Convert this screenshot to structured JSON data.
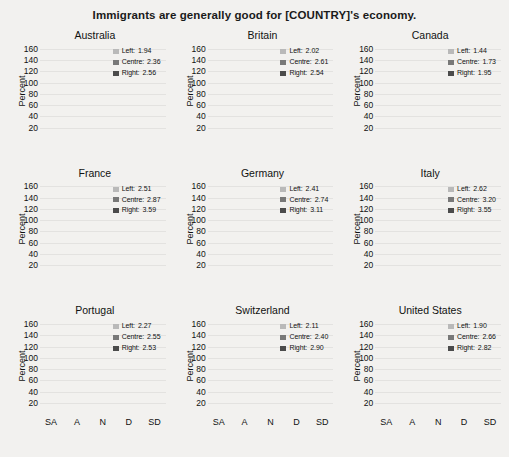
{
  "title": "Immigrants are generally good for [COUNTRY]'s economy.",
  "axis": {
    "ylabel": "Percent",
    "yticks": [
      20,
      40,
      60,
      80,
      100,
      120,
      140,
      160
    ],
    "ylim": [
      0,
      170
    ],
    "xticks": [
      "SA",
      "A",
      "N",
      "D",
      "SD"
    ]
  },
  "series_names": [
    "Left",
    "Centre",
    "Right"
  ],
  "colors": {
    "left": "#b9b9b9",
    "centre": "#787878",
    "right": "#4b4b4b",
    "background": "#f2f1ef",
    "gridline": "#e3e2e0"
  },
  "chart_data": {
    "type": "bar",
    "title": "Immigrants are generally good for [COUNTRY]'s economy.",
    "xlabel": "",
    "ylabel": "Percent",
    "ylim": [
      0,
      170
    ],
    "categories": [
      "SA",
      "A",
      "N",
      "D",
      "SD"
    ],
    "stacked": true,
    "grid": true,
    "legend_position": "top-right",
    "panels": [
      {
        "name": "Australia",
        "legend": [
          {
            "label": "Left:",
            "value": "1.94"
          },
          {
            "label": "Centre:",
            "value": "2.36"
          },
          {
            "label": "Right:",
            "value": "2.56"
          }
        ],
        "series": [
          {
            "name": "Right",
            "values": [
              17,
              46,
              17,
              11,
              9
            ]
          },
          {
            "name": "Centre",
            "values": [
              17,
              44,
              22,
              10,
              5
            ]
          },
          {
            "name": "Left",
            "values": [
              37,
              45,
              12,
              5,
              4
            ]
          }
        ],
        "totals": [
          71,
          135,
          51,
          26,
          18
        ]
      },
      {
        "name": "Britain",
        "legend": [
          {
            "label": "Left:",
            "value": "2.02"
          },
          {
            "label": "Centre:",
            "value": "2.61"
          },
          {
            "label": "Right:",
            "value": "2.54"
          }
        ],
        "series": [
          {
            "name": "Right",
            "values": [
              15,
              37,
              22,
              15,
              8
            ]
          },
          {
            "name": "Centre",
            "values": [
              15,
              42,
              25,
              13,
              5
            ]
          },
          {
            "name": "Left",
            "values": [
              31,
              51,
              12,
              7,
              2
            ]
          }
        ],
        "totals": [
          61,
          130,
          59,
          35,
          15
        ]
      },
      {
        "name": "Canada",
        "legend": [
          {
            "label": "Left:",
            "value": "1.44"
          },
          {
            "label": "Centre:",
            "value": "1.73"
          },
          {
            "label": "Right:",
            "value": "1.95"
          }
        ],
        "series": [
          {
            "name": "Right",
            "values": [
              39,
              46,
              10,
              9,
              4
            ]
          },
          {
            "name": "Centre",
            "values": [
              46,
              40,
              5,
              6,
              2
            ]
          },
          {
            "name": "Left",
            "values": [
              66,
              27,
              1,
              1,
              0
            ]
          }
        ],
        "totals": [
          151,
          113,
          16,
          16,
          6
        ]
      },
      {
        "name": "France",
        "legend": [
          {
            "label": "Left:",
            "value": "2.51"
          },
          {
            "label": "Centre:",
            "value": "2.87"
          },
          {
            "label": "Right:",
            "value": "3.59"
          }
        ],
        "series": [
          {
            "name": "Right",
            "values": [
              11,
              21,
              21,
              23,
              29
            ]
          },
          {
            "name": "Centre",
            "values": [
              10,
              35,
              29,
              24,
              13
            ]
          },
          {
            "name": "Left",
            "values": [
              11,
              40,
              15,
              10,
              7
            ]
          }
        ],
        "totals": [
          32,
          96,
          65,
          57,
          49
        ]
      },
      {
        "name": "Germany",
        "legend": [
          {
            "label": "Left:",
            "value": "2.41"
          },
          {
            "label": "Centre:",
            "value": "2.74"
          },
          {
            "label": "Right:",
            "value": "3.11"
          }
        ],
        "series": [
          {
            "name": "Right",
            "values": [
              13,
              19,
              43,
              20,
              17
            ]
          },
          {
            "name": "Centre",
            "values": [
              10,
              29,
              45,
              12,
              3
            ]
          },
          {
            "name": "Left",
            "values": [
              11,
              37,
              35,
              8,
              1
            ]
          }
        ],
        "totals": [
          34,
          85,
          123,
          40,
          21
        ]
      },
      {
        "name": "Italy",
        "legend": [
          {
            "label": "Left:",
            "value": "2.62"
          },
          {
            "label": "Centre:",
            "value": "3.20"
          },
          {
            "label": "Right:",
            "value": "3.55"
          }
        ],
        "series": [
          {
            "name": "Right",
            "values": [
              11,
              22,
              21,
              24,
              33
            ]
          },
          {
            "name": "Centre",
            "values": [
              9,
              30,
              26,
              25,
              17
            ]
          },
          {
            "name": "Left",
            "values": [
              11,
              36,
              10,
              14,
              12
            ]
          }
        ],
        "totals": [
          31,
          88,
          57,
          63,
          62
        ]
      },
      {
        "name": "Portugal",
        "legend": [
          {
            "label": "Left:",
            "value": "2.27"
          },
          {
            "label": "Centre:",
            "value": "2.55"
          },
          {
            "label": "Right:",
            "value": "2.53"
          }
        ],
        "series": [
          {
            "name": "Right",
            "values": [
              14,
              48,
              23,
              16,
              4
            ]
          },
          {
            "name": "Centre",
            "values": [
              8,
              52,
              28,
              15,
              1
            ]
          },
          {
            "name": "Left",
            "values": [
              9,
              59,
              13,
              11,
              1
            ]
          }
        ],
        "totals": [
          31,
          159,
          64,
          42,
          6
        ]
      },
      {
        "name": "Switzerland",
        "legend": [
          {
            "label": "Left:",
            "value": "2.11"
          },
          {
            "label": "Centre:",
            "value": "2.40"
          },
          {
            "label": "Right:",
            "value": "2.90"
          }
        ],
        "series": [
          {
            "name": "Right",
            "values": [
              13,
              34,
              25,
              22,
              11
            ]
          },
          {
            "name": "Centre",
            "values": [
              12,
              53,
              24,
              14,
              2
            ]
          },
          {
            "name": "Left",
            "values": [
              17,
              54,
              15,
              3,
              1
            ]
          }
        ],
        "totals": [
          42,
          141,
          64,
          39,
          14
        ]
      },
      {
        "name": "United States",
        "legend": [
          {
            "label": "Left:",
            "value": "1.90"
          },
          {
            "label": "Centre:",
            "value": "2.66"
          },
          {
            "label": "Right:",
            "value": "2.82"
          }
        ],
        "series": [
          {
            "name": "Right",
            "values": [
              14,
              33,
              21,
              18,
              10
            ]
          },
          {
            "name": "Centre",
            "values": [
              11,
              28,
              36,
              13,
              4
            ]
          },
          {
            "name": "Left",
            "values": [
              37,
              51,
              15,
              6,
              2
            ]
          }
        ],
        "totals": [
          62,
          112,
          72,
          37,
          16
        ]
      }
    ]
  }
}
